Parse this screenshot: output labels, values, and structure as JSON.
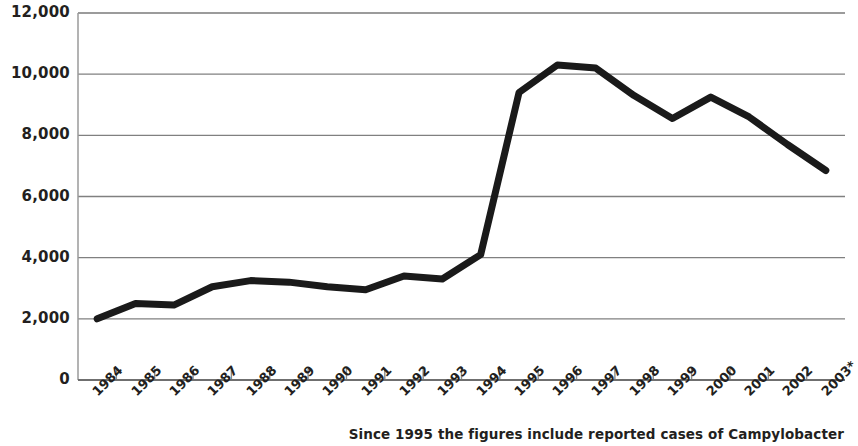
{
  "chart_data": {
    "type": "line",
    "title": "",
    "xlabel": "",
    "ylabel": "",
    "categories": [
      "1984",
      "1985",
      "1986",
      "1987",
      "1988",
      "1989",
      "1990",
      "1991",
      "1992",
      "1993",
      "1994",
      "1995",
      "1996",
      "1997",
      "1998",
      "1999",
      "2000",
      "2001",
      "2002",
      "2003*"
    ],
    "values": [
      2000,
      2500,
      2450,
      3050,
      3250,
      3200,
      3050,
      2950,
      3400,
      3300,
      4100,
      9400,
      10300,
      10200,
      9300,
      8550,
      9250,
      8600,
      7700,
      6850
    ],
    "series": [
      {
        "name": "Reported cases",
        "values": [
          2000,
          2500,
          2450,
          3050,
          3250,
          3200,
          3050,
          2950,
          3400,
          3300,
          4100,
          9400,
          10300,
          10200,
          9300,
          8550,
          9250,
          8600,
          7700,
          6850
        ]
      }
    ],
    "ylim": [
      0,
      12000
    ],
    "ytick_values": [
      0,
      2000,
      4000,
      6000,
      8000,
      10000,
      12000
    ],
    "ytick_labels": [
      "0",
      "2,000",
      "4,000",
      "6,000",
      "8,000",
      "10,000",
      "12,000"
    ],
    "grid": true,
    "grid_axis": "y",
    "legend": false,
    "legend_position": "none",
    "line_color": "#1a1a1a",
    "line_width": 7,
    "grid_color": "#808080",
    "axis_color": "#808080",
    "background_color": "#ffffff",
    "annotations": [
      {
        "name": "footnote",
        "text": "Since 1995 the figures include reported cases of Campylobacter",
        "position": "bottom-right"
      }
    ]
  },
  "footnote": {
    "text": "Since 1995 the figures include reported cases of Campylobacter"
  },
  "axes": {
    "y_title": "",
    "x_title": ""
  }
}
